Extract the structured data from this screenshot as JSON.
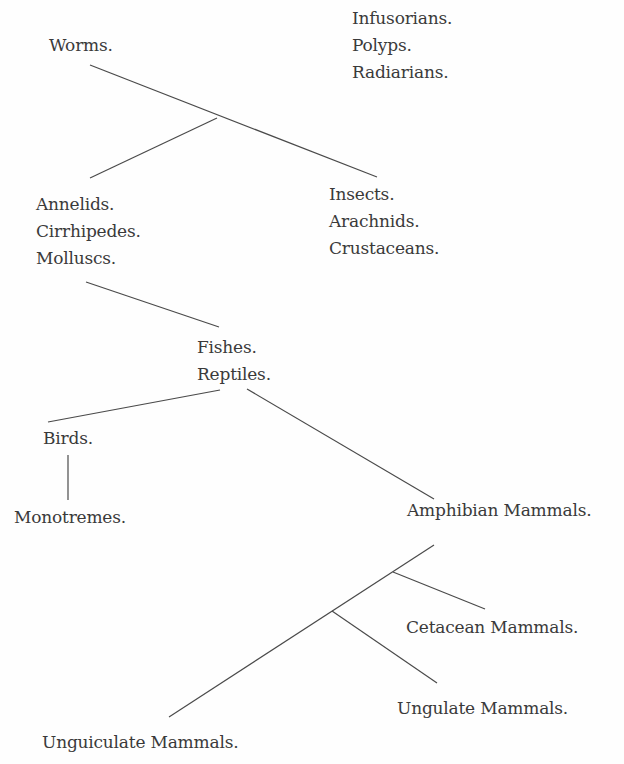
{
  "diagram": {
    "type": "evolutionary-tree",
    "nodes": [
      {
        "id": "infusorians",
        "labels": [
          "Infusorians.",
          "Polyps.",
          "Radiarians."
        ],
        "x": 352,
        "y": 5
      },
      {
        "id": "worms",
        "labels": [
          "Worms."
        ],
        "x": 49,
        "y": 32
      },
      {
        "id": "insects",
        "labels": [
          "Insects.",
          "Arachnids.",
          "Crustaceans."
        ],
        "x": 329,
        "y": 181
      },
      {
        "id": "annelids",
        "labels": [
          "Annelids.",
          "Cirrhipedes.",
          "Molluscs."
        ],
        "x": 36,
        "y": 191
      },
      {
        "id": "fishes",
        "labels": [
          "Fishes.",
          "Reptiles."
        ],
        "x": 197,
        "y": 334
      },
      {
        "id": "birds",
        "labels": [
          "Birds."
        ],
        "x": 43,
        "y": 425
      },
      {
        "id": "monotremes",
        "labels": [
          "Monotremes."
        ],
        "x": 14,
        "y": 504
      },
      {
        "id": "amphibian",
        "labels": [
          "Amphibian Mammals."
        ],
        "x": 407,
        "y": 497
      },
      {
        "id": "cetacean",
        "labels": [
          "Cetacean Mammals."
        ],
        "x": 406,
        "y": 614
      },
      {
        "id": "ungulate",
        "labels": [
          "Ungulate Mammals."
        ],
        "x": 397,
        "y": 695
      },
      {
        "id": "unguiculate",
        "labels": [
          "Unguiculate Mammals."
        ],
        "x": 42,
        "y": 729
      }
    ],
    "edges": [
      {
        "from": "worms",
        "to": "insects",
        "x1": 90,
        "y1": 65,
        "x2": 377,
        "y2": 177
      },
      {
        "from": "worms-branch",
        "to": "annelids",
        "x1": 217,
        "y1": 118,
        "x2": 90,
        "y2": 178
      },
      {
        "from": "annelids",
        "to": "fishes",
        "x1": 86,
        "y1": 282,
        "x2": 219,
        "y2": 327
      },
      {
        "from": "fishes",
        "to": "birds",
        "x1": 220,
        "y1": 390,
        "x2": 48,
        "y2": 422
      },
      {
        "from": "fishes",
        "to": "amphibian",
        "x1": 247,
        "y1": 389,
        "x2": 434,
        "y2": 499
      },
      {
        "from": "birds",
        "to": "monotremes",
        "x1": 68,
        "y1": 455,
        "x2": 68,
        "y2": 500
      },
      {
        "from": "amphibian",
        "to": "unguiculate",
        "x1": 434,
        "y1": 545,
        "x2": 169,
        "y2": 717
      },
      {
        "from": "amphibian-branch",
        "to": "cetacean",
        "x1": 393,
        "y1": 572,
        "x2": 485,
        "y2": 609
      },
      {
        "from": "amphibian-branch-2",
        "to": "ungulate",
        "x1": 332,
        "y1": 611,
        "x2": 437,
        "y2": 683
      }
    ],
    "line_color": "#4a4a4a",
    "text_color": "#3a3a3a",
    "background": "#fefefe"
  }
}
